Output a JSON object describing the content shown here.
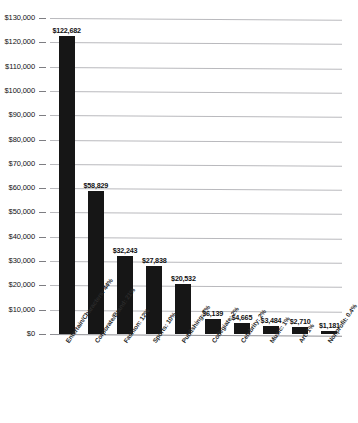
{
  "chart_data": {
    "type": "bar",
    "title": "",
    "xlabel": "",
    "ylabel": "",
    "ylim": [
      0,
      130000
    ],
    "grid": true,
    "legend": "none",
    "categories": [
      "Entertain/Characters: 44%",
      "Corporate/Brand: 21%",
      "Fashion: 12%",
      "Sports: 10%",
      "Publishing: 7%",
      "Collegiate: 2%",
      "Celebrity: 2%",
      "Music: 1%",
      "Art: 1%",
      "Nonprofit: 0.4%"
    ],
    "values": [
      122682,
      58829,
      32243,
      27838,
      20532,
      6139,
      4665,
      3484,
      2710,
      1181
    ],
    "value_labels": [
      "$122,682",
      "$58,829",
      "$32,243",
      "$27,838",
      "$20,532",
      "$6,139",
      "$4,665",
      "$3,484",
      "$2,710",
      "$1,181"
    ],
    "ytick_labels": [
      "$130,000",
      "$120,000",
      "$110,000",
      "$100,000",
      "$90,000",
      "$80,000",
      "$70,000",
      "$60,000",
      "$50,000",
      "$40,000",
      "$30,000",
      "$20,000",
      "$10,000",
      "$0"
    ],
    "ytick_values": [
      130000,
      120000,
      110000,
      100000,
      90000,
      80000,
      70000,
      60000,
      50000,
      40000,
      30000,
      20000,
      10000,
      0
    ],
    "bar_color": "#161616",
    "grid_color": "#b9b9bd"
  }
}
